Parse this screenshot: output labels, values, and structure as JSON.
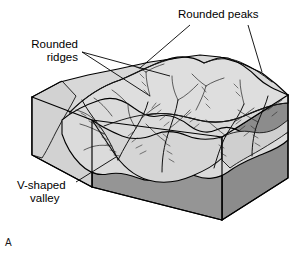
{
  "figure": {
    "letter": "A",
    "caption_labels": {
      "peaks": "Rounded peaks",
      "ridges_line1": "Rounded",
      "ridges_line2": "ridges",
      "valley_line1": "V-shaped",
      "valley_line2": "valley"
    },
    "colors": {
      "background": "#ffffff",
      "top_surface": "#d9d9d9",
      "top_surface_light": "#e2e2e2",
      "left_face": "#d2d2d2",
      "front_face": "#909090",
      "right_face": "#8b8b8b",
      "outline": "#000000",
      "text": "#000000"
    }
  },
  "annotations": [
    {
      "id": "rounded-peaks",
      "label": "Rounded peaks",
      "leader_count": 2,
      "points_to": "two rounded summits on the upper ridge crest"
    },
    {
      "id": "rounded-ridges",
      "label": "Rounded ridges",
      "leader_count": 2,
      "points_to": "smooth convex interfluve ridges on the left massif"
    },
    {
      "id": "v-shaped-valley",
      "label": "V-shaped valley",
      "leader_count": 1,
      "points_to": "stream-cut notch at the front of the block"
    }
  ]
}
